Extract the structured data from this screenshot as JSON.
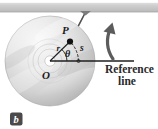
{
  "figure": {
    "panel_label": "b",
    "caption_line1": "Reference",
    "caption_line2": "line",
    "labels": {
      "point_p": "P",
      "radius": "r",
      "angle": "θ",
      "arc": "s",
      "center": "O"
    },
    "colors": {
      "disc_light": "#f2f2f2",
      "disc_mid": "#d4d4d4",
      "disc_dark": "#b4b4b4",
      "ceiling_bar": "#c9c9c9",
      "line_stroke": "#2e2e2e",
      "badge": "#4a4a4a",
      "rule": "#bfbfbf",
      "background": "#ffffff"
    },
    "geometry": {
      "disc_center_x": 50,
      "disc_center_y": 61,
      "disc_radius": 45,
      "hub_radius": 5,
      "point_p_x": 70,
      "point_p_y": 41,
      "reference_line_end_x": 134,
      "rotation_direction": "counterclockwise"
    }
  }
}
